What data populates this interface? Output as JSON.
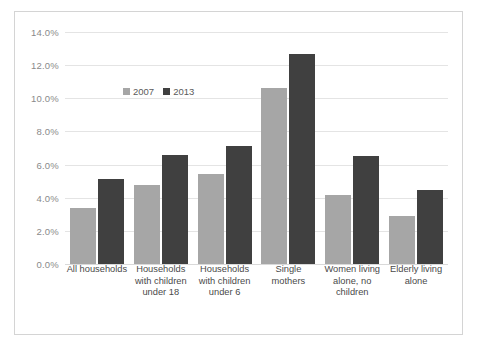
{
  "chart_data": {
    "type": "bar",
    "title": "",
    "subtitle": "",
    "xlabel": "",
    "ylabel": "",
    "ylim": [
      0,
      14
    ],
    "ytick_step": 2,
    "ytick_labels": [
      "14.0%",
      "12.0%",
      "10.0%",
      "8.0%",
      "6.0%",
      "4.0%",
      "2.0%",
      "0.0%"
    ],
    "ytick_values": [
      14,
      12,
      10,
      8,
      6,
      4,
      2,
      0
    ],
    "grid": true,
    "legend_position": "inside-upper-left",
    "categories": [
      "All households",
      "Households with children under 18",
      "Households with children under 6",
      "Single mothers",
      "Women living alone, no children",
      "Elderly living alone"
    ],
    "category_lines": [
      [
        "All households"
      ],
      [
        "Households",
        "with children",
        "under 18"
      ],
      [
        "Households",
        "with children",
        "under 6"
      ],
      [
        "Single mothers"
      ],
      [
        "Women living",
        "alone, no",
        "children"
      ],
      [
        "Elderly living",
        "alone"
      ]
    ],
    "series": [
      {
        "name": "2007",
        "color": "#a6a6a6",
        "values": [
          3.4,
          4.75,
          5.45,
          10.6,
          4.15,
          2.9
        ]
      },
      {
        "name": "2013",
        "color": "#404040",
        "values": [
          5.15,
          6.6,
          7.1,
          12.7,
          6.5,
          4.45
        ]
      }
    ]
  },
  "colors": {
    "series_2007": "#a6a6a6",
    "series_2013": "#404040",
    "gridline": "#e4e4e4",
    "border": "#d4d4d4",
    "tick_text": "#8a8a8a",
    "category_text": "#4a4a4a",
    "background": "#ffffff"
  }
}
